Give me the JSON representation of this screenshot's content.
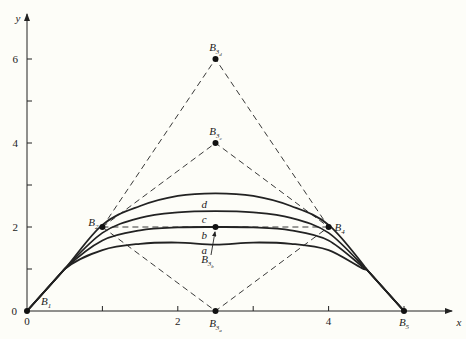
{
  "chart_data": {
    "type": "line",
    "title": "",
    "xlabel": "x",
    "ylabel": "y",
    "xlim": [
      0,
      5.7
    ],
    "ylim": [
      0,
      7
    ],
    "x_ticks": [
      0,
      1,
      2,
      3,
      4,
      5
    ],
    "x_tick_labels": [
      "0",
      "",
      "2",
      "",
      "4",
      ""
    ],
    "y_ticks": [
      0,
      1,
      2,
      3,
      4,
      5,
      6
    ],
    "y_tick_labels": [
      "0",
      "",
      "2",
      "",
      "4",
      "",
      "6"
    ],
    "grid": false,
    "control_points": [
      {
        "name": "B1",
        "label": "B",
        "sub": "1",
        "x": 0,
        "y": 0
      },
      {
        "name": "B2",
        "label": "B",
        "sub": "2",
        "x": 1,
        "y": 2
      },
      {
        "name": "B3a",
        "label": "B",
        "sub": "3a",
        "x": 2.5,
        "y": 0
      },
      {
        "name": "B3b",
        "label": "B",
        "sub": "3b",
        "x": 2.5,
        "y": 2
      },
      {
        "name": "B3c",
        "label": "B",
        "sub": "3c",
        "x": 2.5,
        "y": 4
      },
      {
        "name": "B3d",
        "label": "B",
        "sub": "3d",
        "x": 2.5,
        "y": 6
      },
      {
        "name": "B4",
        "label": "B",
        "sub": "4",
        "x": 4,
        "y": 2
      },
      {
        "name": "B5",
        "label": "B",
        "sub": "5",
        "x": 5,
        "y": 0
      }
    ],
    "polygons": [
      {
        "name": "polygon-a",
        "points": [
          [
            1,
            2
          ],
          [
            2.5,
            0
          ],
          [
            4,
            2
          ]
        ]
      },
      {
        "name": "polygon-b",
        "points": [
          [
            1,
            2
          ],
          [
            2.5,
            2
          ],
          [
            4,
            2
          ]
        ]
      },
      {
        "name": "polygon-c",
        "points": [
          [
            1,
            2
          ],
          [
            2.5,
            4
          ],
          [
            4,
            2
          ]
        ]
      },
      {
        "name": "polygon-d",
        "points": [
          [
            1,
            2
          ],
          [
            2.5,
            6
          ],
          [
            4,
            2
          ]
        ]
      }
    ],
    "x": [
      0,
      0.5,
      1,
      1.5,
      2,
      2.5,
      3,
      3.5,
      4,
      4.5,
      5
    ],
    "series": [
      {
        "name": "a",
        "values": [
          0,
          1,
          1.45,
          1.6,
          1.63,
          1.58,
          1.63,
          1.6,
          1.45,
          1,
          0
        ]
      },
      {
        "name": "b",
        "values": [
          0,
          1,
          1.68,
          1.92,
          1.99,
          2.0,
          1.99,
          1.92,
          1.68,
          1,
          0
        ]
      },
      {
        "name": "c",
        "values": [
          0,
          1,
          1.86,
          2.22,
          2.35,
          2.38,
          2.35,
          2.22,
          1.86,
          1,
          0
        ]
      },
      {
        "name": "d",
        "values": [
          0,
          1,
          2.05,
          2.5,
          2.74,
          2.8,
          2.74,
          2.5,
          2.05,
          1,
          0
        ]
      }
    ],
    "curve_labels": [
      {
        "text": "a",
        "x": 2.35,
        "y": 1.45
      },
      {
        "text": "b",
        "x": 2.35,
        "y": 1.82
      },
      {
        "text": "c",
        "x": 2.35,
        "y": 2.2
      },
      {
        "text": "d",
        "x": 2.35,
        "y": 2.55
      }
    ]
  },
  "colors": {
    "background": "#fdfdf8",
    "ink": "#222222"
  }
}
